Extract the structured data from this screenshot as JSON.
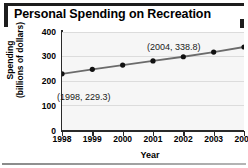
{
  "chart_data": {
    "type": "line",
    "title": "Personal Spending on Recreation",
    "xlabel": "Year",
    "ylabel_line1": "Spending",
    "ylabel_line2": "(billions of dollars)",
    "categories": [
      "1998",
      "1999",
      "2000",
      "2001",
      "2002",
      "2003",
      "2004"
    ],
    "x": [
      1998,
      1999,
      2000,
      2001,
      2002,
      2003,
      2004
    ],
    "values": [
      229.3,
      247.5,
      265.0,
      282.0,
      299.0,
      318.0,
      338.8
    ],
    "series": [
      {
        "name": "Personal spending on recreation",
        "values": [
          229.3,
          247.5,
          265.0,
          282.0,
          299.0,
          318.0,
          338.8
        ]
      }
    ],
    "ylim": [
      0,
      400
    ],
    "yticks": [
      0,
      100,
      200,
      300,
      400
    ],
    "ytick_labels": [
      "0",
      "100",
      "200",
      "300",
      "400"
    ],
    "xlim": [
      1998,
      2004
    ],
    "grid": "horizontal",
    "legend": "none",
    "marker": "filled-circle",
    "line_color": "#6b6b6b",
    "marker_color": "#111111",
    "plot_background": "#f6f6f6",
    "annotations": [
      {
        "id": "first-point",
        "label": "(1998, 229.3)",
        "x": 1998,
        "y": 229.3
      },
      {
        "id": "last-point",
        "label": "(2004, 338.8)",
        "x": 2004,
        "y": 338.8
      }
    ]
  },
  "colors": {
    "title_bar": "#1d1d1d",
    "axis": "#2a2a2a",
    "gridline": "#dcdcdc",
    "rule": "#8a8a8a"
  }
}
